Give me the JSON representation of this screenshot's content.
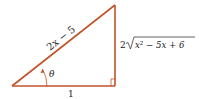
{
  "diagram": {
    "type": "right-triangle",
    "line_color": "#c0532a",
    "labels": {
      "hypotenuse": "2x − 5",
      "adjacent": "1",
      "opposite_coef": "2",
      "opposite_radicand": "x² − 5x + 6",
      "angle": "θ"
    }
  }
}
